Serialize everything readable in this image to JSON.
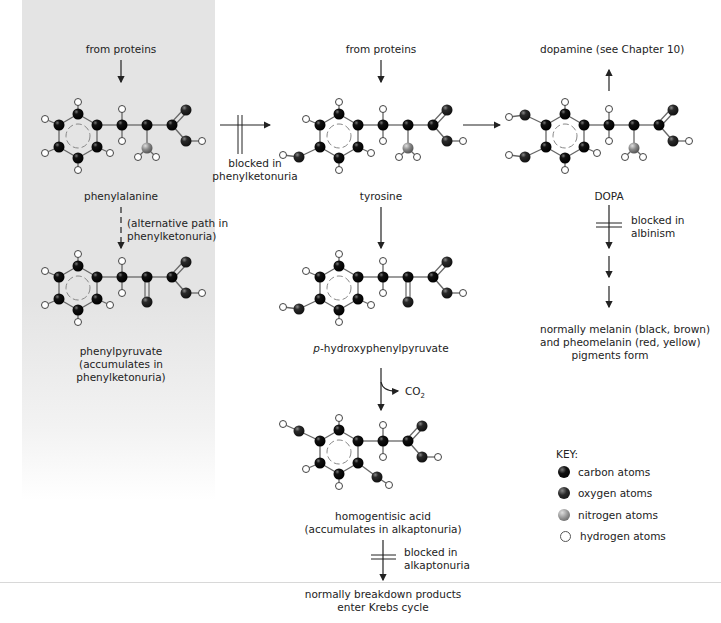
{
  "figure": {
    "colors": {
      "carbon": "#111111",
      "oxygen": "#222222",
      "nitrogen": "#8a8a8a",
      "hydrogen": "#ffffff",
      "panel": "#e4e4e4",
      "text": "#222222"
    },
    "sources": {
      "phenylalanine_source": "from proteins",
      "tyrosine_source": "from proteins",
      "dopamine": "dopamine (see Chapter 10)"
    },
    "molecules": {
      "phenylalanine": "phenylalanine",
      "tyrosine": "tyrosine",
      "dopa": "DOPA",
      "phenylpyruvate_line1": "phenylpyruvate",
      "phenylpyruvate_line2": "(accumulates in",
      "phenylpyruvate_line3": "phenylketonuria)",
      "hydroxyphenylpyruvate_prefix": "p",
      "hydroxyphenylpyruvate_rest": "-hydroxyphenylpyruvate",
      "homogentisic_line1": "homogentisic acid",
      "homogentisic_line2": "(accumulates in alkaptonuria)"
    },
    "annotations": {
      "pku_block_line1": "blocked in",
      "pku_block_line2": "phenylketonuria",
      "alt_path_line1": "(alternative path in",
      "alt_path_line2": "phenylketonuria)",
      "albinism_line1": "blocked in",
      "albinism_line2": "albinism",
      "alkaptonuria_line1": "blocked in",
      "alkaptonuria_line2": "alkaptonuria",
      "co2": "CO",
      "co2_sub": "2"
    },
    "outcomes": {
      "melanin_line1": "normally melanin (black, brown)",
      "melanin_line2": "and pheomelanin (red, yellow)",
      "melanin_line3": "pigments form",
      "krebs_line1": "normally breakdown products",
      "krebs_line2": "enter Krebs cycle"
    },
    "key": {
      "title": "KEY:",
      "items": [
        {
          "label": "carbon atoms",
          "atom": "carbon"
        },
        {
          "label": "oxygen atoms",
          "atom": "oxygen"
        },
        {
          "label": "nitrogen atoms",
          "atom": "nitrogen"
        },
        {
          "label": "hydrogen atoms",
          "atom": "hydrogen"
        }
      ]
    }
  }
}
